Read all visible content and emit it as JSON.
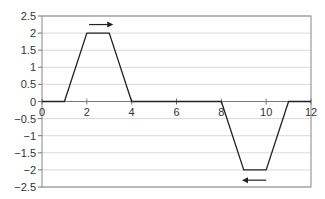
{
  "chart_data": {
    "type": "line",
    "title": "",
    "xlabel": "",
    "ylabel": "",
    "xlim": [
      0,
      12
    ],
    "ylim": [
      -2.5,
      2.5
    ],
    "x_ticks": [
      0,
      2,
      4,
      6,
      8,
      10,
      12
    ],
    "x_tick_labels": [
      "0",
      "2",
      "4",
      "6",
      "8",
      "10",
      "12"
    ],
    "y_ticks": [
      2.5,
      2,
      1.5,
      1,
      0.5,
      0,
      -0.5,
      -1,
      -1.5,
      -2,
      -2.5
    ],
    "y_tick_labels": [
      "2.5",
      "2",
      "1.5",
      "1",
      "0.5",
      "0",
      "−0.5",
      "−1",
      "−1.5",
      "−2",
      "−2.5"
    ],
    "grid": "horizontal",
    "legend": "none",
    "series": [
      {
        "name": "velocity",
        "x": [
          0,
          1,
          2,
          3,
          4,
          8,
          9,
          10,
          11,
          12
        ],
        "y": [
          0,
          0,
          2,
          2,
          0,
          0,
          -2,
          -2,
          0,
          0
        ]
      }
    ],
    "annotations": [
      {
        "type": "arrow",
        "direction": "right",
        "x_from": 2.1,
        "x_to": 3.0,
        "y": 2.25
      },
      {
        "type": "arrow",
        "direction": "left",
        "x_from": 10.0,
        "x_to": 9.1,
        "y": -2.3
      }
    ]
  },
  "colors": {
    "line": "#222222",
    "grid": "#d9d9d9",
    "axis": "#777777",
    "frame": "#888888"
  }
}
